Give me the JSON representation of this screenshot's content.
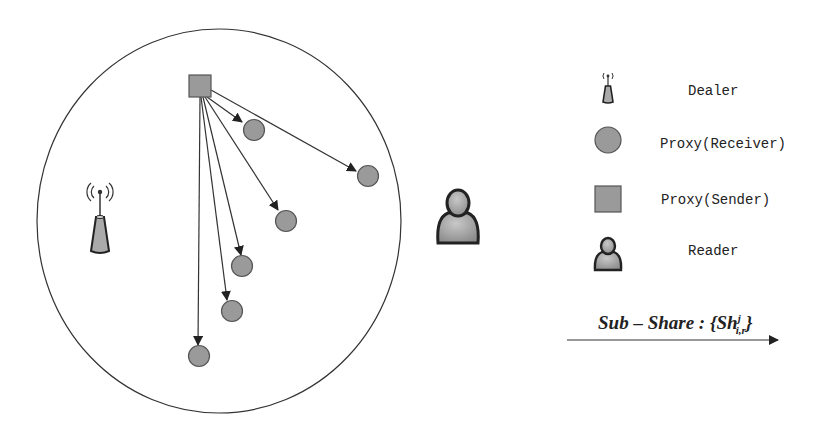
{
  "diagram": {
    "region": {
      "shape": "ellipse",
      "cx": 219,
      "cy": 221,
      "rx": 182,
      "ry": 192
    },
    "sender": {
      "label": "Proxy(Sender)",
      "x": 189,
      "y": 75,
      "size": 22,
      "origin": [
        200,
        97
      ]
    },
    "receivers": [
      {
        "cx": 254,
        "cy": 130
      },
      {
        "cx": 368,
        "cy": 176
      },
      {
        "cx": 286,
        "cy": 221
      },
      {
        "cx": 242,
        "cy": 266
      },
      {
        "cx": 232,
        "cy": 311
      },
      {
        "cx": 199,
        "cy": 356
      }
    ],
    "dealer": {
      "x": 100,
      "y": 215
    },
    "reader": {
      "x": 458,
      "y": 215
    },
    "colors": {
      "node_fill": "#9a9a9a",
      "node_stroke": "#555555",
      "line": "#333333"
    }
  },
  "legend": {
    "items": [
      {
        "icon": "antenna-icon",
        "label": "Dealer"
      },
      {
        "icon": "circle-node-icon",
        "label": "Proxy(Receiver)"
      },
      {
        "icon": "square-node-icon",
        "label": "Proxy(Sender)"
      },
      {
        "icon": "person-icon",
        "label": "Reader"
      }
    ],
    "arrow": {
      "label_main": "Sub – Share : {Sh",
      "label_sup": "j",
      "label_sub": "i,r",
      "label_close": "}"
    }
  }
}
